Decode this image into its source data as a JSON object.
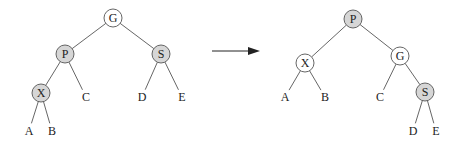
{
  "diagram": {
    "colors": {
      "edge": "#555555",
      "node_stroke": "#555555",
      "shaded_fill": "#d6d6d6",
      "unshaded_fill": "#ffffff",
      "text": "#222222",
      "arrow": "#222222"
    },
    "before": {
      "nodes": [
        {
          "id": "G",
          "label": "G",
          "x": 113,
          "y": 18,
          "shaded": false
        },
        {
          "id": "P",
          "label": "P",
          "x": 65,
          "y": 54,
          "shaded": true
        },
        {
          "id": "S",
          "label": "S",
          "x": 161,
          "y": 54,
          "shaded": true
        },
        {
          "id": "X",
          "label": "X",
          "x": 41,
          "y": 93,
          "shaded": true
        }
      ],
      "leaves": [
        {
          "id": "C",
          "label": "C",
          "x": 86,
          "y": 97
        },
        {
          "id": "D",
          "label": "D",
          "x": 142,
          "y": 97
        },
        {
          "id": "E",
          "label": "E",
          "x": 182,
          "y": 97
        },
        {
          "id": "A",
          "label": "A",
          "x": 29,
          "y": 131
        },
        {
          "id": "B",
          "label": "B",
          "x": 52,
          "y": 131
        }
      ],
      "edges": [
        [
          "G",
          "P"
        ],
        [
          "G",
          "S"
        ],
        [
          "P",
          "X"
        ],
        [
          "P",
          "C"
        ],
        [
          "S",
          "D"
        ],
        [
          "S",
          "E"
        ],
        [
          "X",
          "A"
        ],
        [
          "X",
          "B"
        ]
      ]
    },
    "arrow": {
      "x1": 212,
      "y1": 51,
      "x2": 260,
      "y2": 51
    },
    "after": {
      "nodes": [
        {
          "id": "P",
          "label": "P",
          "x": 353,
          "y": 19,
          "shaded": true
        },
        {
          "id": "X",
          "label": "X",
          "x": 305,
          "y": 63,
          "shaded": false
        },
        {
          "id": "G",
          "label": "G",
          "x": 400,
          "y": 56,
          "shaded": false
        },
        {
          "id": "S",
          "label": "S",
          "x": 425,
          "y": 92,
          "shaded": true
        }
      ],
      "leaves": [
        {
          "id": "A",
          "label": "A",
          "x": 285,
          "y": 97
        },
        {
          "id": "B",
          "label": "B",
          "x": 325,
          "y": 97
        },
        {
          "id": "C",
          "label": "C",
          "x": 380,
          "y": 97
        },
        {
          "id": "D",
          "label": "D",
          "x": 413,
          "y": 131
        },
        {
          "id": "E",
          "label": "E",
          "x": 436,
          "y": 131
        }
      ],
      "edges": [
        [
          "P",
          "X"
        ],
        [
          "P",
          "G"
        ],
        [
          "X",
          "A"
        ],
        [
          "X",
          "B"
        ],
        [
          "G",
          "C"
        ],
        [
          "G",
          "S"
        ],
        [
          "S",
          "D"
        ],
        [
          "S",
          "E"
        ]
      ]
    },
    "node_radius": 9
  }
}
